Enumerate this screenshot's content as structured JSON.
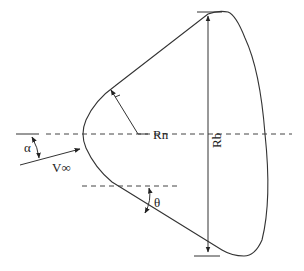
{
  "diagram": {
    "type": "capsule-geometry",
    "labels": {
      "nose_radius": "Rn",
      "base_radius": "Rb",
      "freestream_velocity": "V∞",
      "angle_of_attack": "α",
      "cone_half_angle": "θ"
    },
    "colors": {
      "stroke": "#333333",
      "background": "#ffffff"
    }
  }
}
